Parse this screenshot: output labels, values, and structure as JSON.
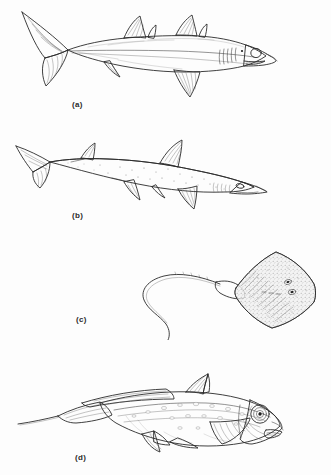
{
  "plate": {
    "title": "Cartilaginous fishes plate",
    "background_color": "#ffffff",
    "ink_color": "#2a2a2a",
    "panel_count": 4
  },
  "figures": [
    {
      "key": "a",
      "label": "(a)",
      "subject": "shark",
      "description": "Shark in lateral view facing right, two dorsal fins, large heterocercal caudal fin, pectoral and pelvic fins, five gill slits, prominent dark eye",
      "orientation": "facing-right",
      "shading": "smooth-gradient"
    },
    {
      "key": "b",
      "label": "(b)",
      "subject": "dogfish-shark",
      "description": "Dogfish or smoothhound shark in lateral view facing right, tall first dorsal fin, smaller second dorsal fin, stippled speckled body, pointed snout",
      "orientation": "facing-right",
      "shading": "stippled-speckled"
    },
    {
      "key": "c",
      "label": "(c)",
      "subject": "skate-ray",
      "description": "Skate or ray in dorsal view, diamond-shaped pectoral disc to the right, long whip-like tail curving in an S to the left",
      "orientation": "dorsal-view",
      "shading": "stippled"
    },
    {
      "key": "d",
      "label": "(d)",
      "subject": "chimaera-ratfish",
      "description": "Chimaera or ratfish in lateral view facing right, very large round eye, tall spined first dorsal fin, broad pectoral fins, long tapering whip tail",
      "orientation": "facing-right",
      "shading": "hatched-spotted"
    }
  ],
  "icons": {
    "fish_a": "shark-icon",
    "fish_b": "dogfish-icon",
    "fish_c": "ray-icon",
    "fish_d": "chimaera-icon"
  }
}
